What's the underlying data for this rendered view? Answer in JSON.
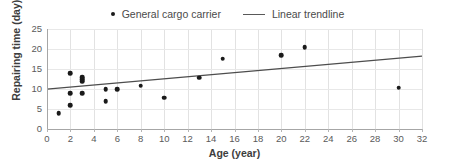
{
  "chart_data": {
    "type": "scatter",
    "title": "",
    "xlabel": "Age (year)",
    "ylabel": "Repairing time (day)",
    "xlim": [
      0,
      32
    ],
    "ylim": [
      0,
      25
    ],
    "xticks": [
      0,
      2,
      4,
      6,
      8,
      10,
      12,
      14,
      16,
      18,
      20,
      22,
      24,
      26,
      28,
      30,
      32
    ],
    "yticks": [
      0,
      5,
      10,
      15,
      20,
      25
    ],
    "grid": "vertical-and-horizontal-light",
    "legend_position": "top-center",
    "series": [
      {
        "name": "General cargo carrier",
        "type": "scatter",
        "marker": "circle",
        "color": "#1a1a1a",
        "points": [
          {
            "x": 1,
            "y": 4.0
          },
          {
            "x": 2,
            "y": 5.9
          },
          {
            "x": 2,
            "y": 8.9
          },
          {
            "x": 2,
            "y": 13.9
          },
          {
            "x": 3,
            "y": 8.9
          },
          {
            "x": 3,
            "y": 11.9
          },
          {
            "x": 3,
            "y": 12.4
          },
          {
            "x": 3,
            "y": 12.9
          },
          {
            "x": 5,
            "y": 6.9
          },
          {
            "x": 5,
            "y": 9.9
          },
          {
            "x": 6,
            "y": 9.9
          },
          {
            "x": 8,
            "y": 10.8
          },
          {
            "x": 10,
            "y": 7.8
          },
          {
            "x": 13,
            "y": 12.8
          },
          {
            "x": 15,
            "y": 17.6
          },
          {
            "x": 20,
            "y": 18.5
          },
          {
            "x": 22,
            "y": 20.4
          },
          {
            "x": 30,
            "y": 10.3
          }
        ]
      },
      {
        "name": "Linear trendline",
        "type": "line",
        "color": "#4d4d4d",
        "endpoints": [
          {
            "x": 0,
            "y": 9.95
          },
          {
            "x": 32,
            "y": 18.2
          }
        ]
      }
    ]
  },
  "legend": {
    "entries": [
      {
        "label": "General cargo carrier",
        "marker": "dot"
      },
      {
        "label": "Linear trendline",
        "marker": "line"
      }
    ]
  },
  "axes": {
    "x_title": "Age (year)",
    "y_title": "Repairing time (day)",
    "x_tick_labels": [
      "0",
      "2",
      "4",
      "6",
      "8",
      "10",
      "12",
      "14",
      "16",
      "18",
      "20",
      "22",
      "24",
      "26",
      "28",
      "30",
      "32"
    ],
    "y_tick_labels": [
      "0",
      "5",
      "10",
      "15",
      "20",
      "25"
    ]
  },
  "colors": {
    "marker": "#1a1a1a",
    "trendline": "#4d4d4d",
    "gridline": "#e2e2e2",
    "axis": "#a6a6a6",
    "text": "#5a5a5a",
    "background": "#ffffff"
  }
}
